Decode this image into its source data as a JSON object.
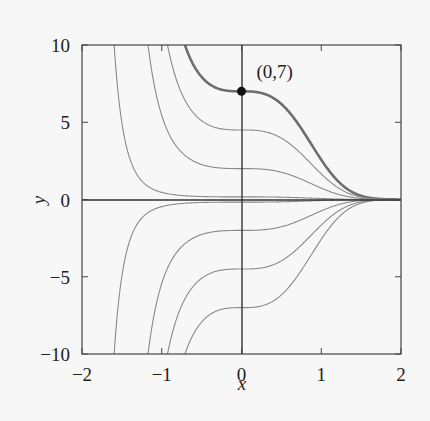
{
  "chart_data": {
    "type": "line",
    "title": "",
    "xlabel": "x",
    "ylabel": "y",
    "xlim": [
      -2,
      2
    ],
    "ylim": [
      -10,
      10
    ],
    "grid": false,
    "legend": null,
    "xticks": [
      -2,
      -1,
      0,
      1,
      2
    ],
    "xtick_labels": [
      "−2",
      "−1",
      "0",
      "1",
      "2"
    ],
    "yticks": [
      -10,
      -5,
      0,
      5,
      10
    ],
    "ytick_labels": [
      "−10",
      "−5",
      "0",
      "5",
      "10"
    ],
    "family": "y = C·exp(−x³)",
    "series": [
      {
        "name": "C=7",
        "C": 7,
        "highlight": true
      },
      {
        "name": "C=4.5",
        "C": 4.5
      },
      {
        "name": "C=2",
        "C": 2
      },
      {
        "name": "C=0.17",
        "C": 0.17
      },
      {
        "name": "C=0",
        "C": 0
      },
      {
        "name": "C=-0.17",
        "C": -0.17
      },
      {
        "name": "C=-2",
        "C": -2
      },
      {
        "name": "C=-4.5",
        "C": -4.5
      },
      {
        "name": "C=-7",
        "C": -7
      }
    ],
    "annotations": [
      {
        "text": "(0,7)",
        "point": [
          0,
          7
        ]
      }
    ],
    "colors": {
      "curve": "#8a8a8a",
      "highlight": "#6e6e6e",
      "axis": "#333333",
      "point": "#111111"
    }
  }
}
